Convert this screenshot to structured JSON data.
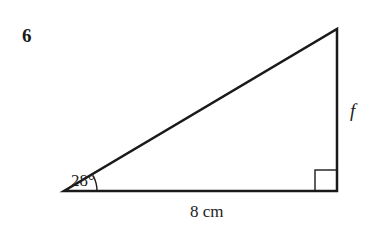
{
  "question": {
    "number": "6"
  },
  "diagram": {
    "type": "right-triangle",
    "angle_label": "28°",
    "base_label": "8 cm",
    "side_label": "f",
    "right_angle_marker": true,
    "stroke_color": "#1a1a1a"
  }
}
